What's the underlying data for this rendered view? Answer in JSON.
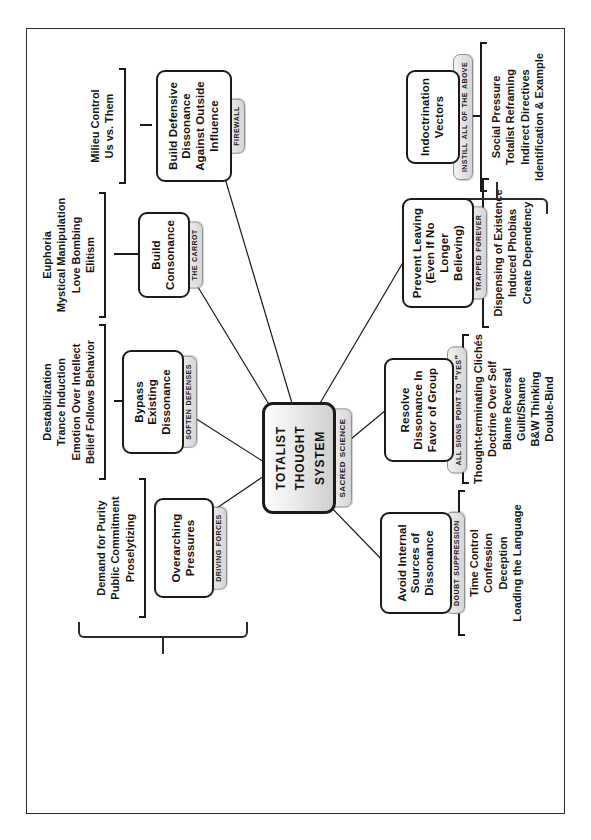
{
  "diagram": {
    "title": "Totalist Thought System",
    "orientation": "rotated-90-ccw",
    "center": {
      "label": "Totalist Thought System",
      "tag": "Sacred Science"
    },
    "nodes": [
      {
        "id": "overarching-pressures",
        "label": "Overarching Pressures",
        "tag": "Driving Forces",
        "leaves": [
          "Demand for Purity",
          "Public Commitment",
          "Proselytizing"
        ]
      },
      {
        "id": "bypass-existing-dissonance",
        "label": "Bypass Existing Dissonance",
        "tag": "Soften Defenses",
        "leaves": [
          "Destabilization",
          "Trance Induction",
          "Emotion Over Intellect",
          "Belief Follows Behavior"
        ]
      },
      {
        "id": "build-consonance",
        "label": "Build Consonance",
        "tag": "The Carrot",
        "leaves": [
          "Euphoria",
          "Mystical Manipulation",
          "Love Bombing",
          "Elitism"
        ]
      },
      {
        "id": "build-defensive-dissonance",
        "label": "Build Defensive Dissonance Against Outside Influence",
        "tag": "Firewall",
        "leaves": [
          "Milieu Control",
          "Us vs. Them"
        ]
      },
      {
        "id": "avoid-internal-sources",
        "label": "Avoid Internal Sources of Dissonance",
        "tag": "Doubt Suppression",
        "leaves": [
          "Time Control",
          "Confession",
          "Deception",
          "Loading the Language"
        ]
      },
      {
        "id": "resolve-dissonance",
        "label": "Resolve Dissonance In Favor of Group",
        "tag": "All Signs Point To \"Yes\"",
        "leaves": [
          "Thought-terminating Clichés",
          "Doctrine Over Self",
          "Blame Reversal",
          "Guilt/Shame",
          "B&W Thinking",
          "Double-Bind"
        ]
      },
      {
        "id": "prevent-leaving",
        "label": "Prevent Leaving (Even If No Longer Believing)",
        "tag": "Trapped Forever",
        "leaves": [
          "Dispensing of Existence",
          "Induced Phobias",
          "Create Dependency"
        ]
      },
      {
        "id": "indoctrination-vectors",
        "label": "Indoctrination Vectors",
        "tag": "Instill All of the Above",
        "leaves": [
          "Social Pressure",
          "Totalist Reframing",
          "Indirect Directives",
          "Identification & Example"
        ]
      }
    ],
    "colors": {
      "border": "#1a1a1a",
      "frame": "#2b2b2b",
      "tag_fill": "#e2e2e2",
      "center_fill": "#e9e9e9",
      "background": "#ffffff",
      "text": "#111111"
    }
  }
}
